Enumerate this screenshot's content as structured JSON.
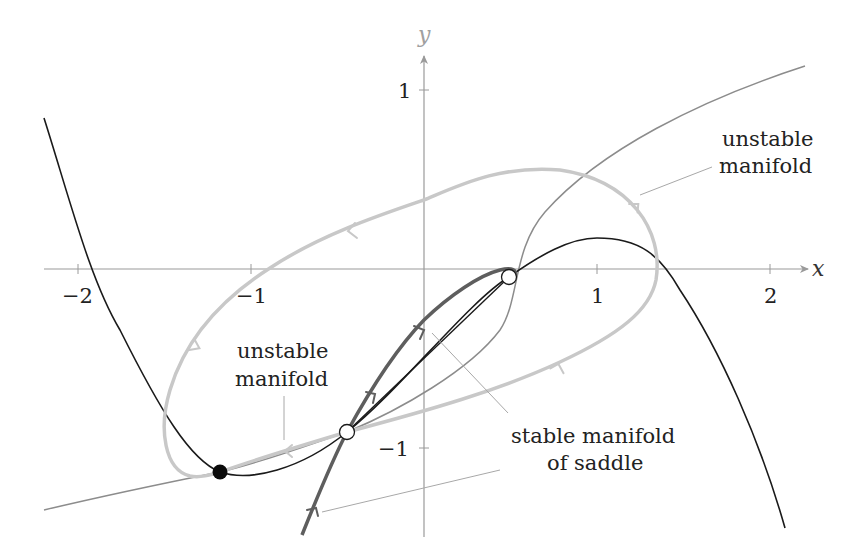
{
  "figure": {
    "type": "phase-portrait",
    "axes": {
      "x_label": "x",
      "y_label": "y",
      "x_ticks": [
        {
          "value": -2,
          "label": "−2"
        },
        {
          "value": -1,
          "label": "−1"
        },
        {
          "value": 1,
          "label": "1"
        },
        {
          "value": 2,
          "label": "2"
        }
      ],
      "y_ticks": [
        {
          "value": 1,
          "label": "1"
        },
        {
          "value": -1,
          "label": "−1"
        }
      ],
      "x_range": [
        -2.2,
        2.3
      ],
      "y_range": [
        -1.5,
        1.3
      ]
    },
    "annotations": {
      "unstable_manifold_right": [
        "unstable",
        "manifold"
      ],
      "unstable_manifold_left": [
        "unstable",
        "manifold"
      ],
      "stable_manifold": [
        "stable manifold",
        "of saddle"
      ]
    },
    "fixed_points": [
      {
        "name": "stable node",
        "x": -1.18,
        "y": -1.13,
        "style": "filled-black"
      },
      {
        "name": "saddle",
        "x": -0.45,
        "y": -0.91,
        "style": "open-white"
      },
      {
        "name": "unstable point",
        "x": 0.49,
        "y": -0.04,
        "style": "open-white"
      }
    ],
    "colors": {
      "axis": "#9a9a9a",
      "nullcline_black": "#1a1a1a",
      "nullcline_gray": "#8c8c8c",
      "unstable_manifold": "#c8c8c8",
      "stable_manifold": "#5e5e5e",
      "leader_line": "#a8a8a8"
    }
  }
}
